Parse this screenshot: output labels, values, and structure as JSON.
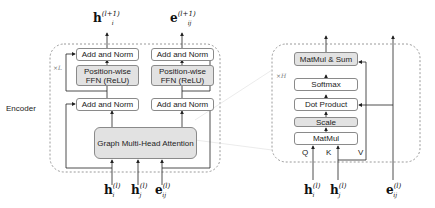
{
  "encoder": {
    "label": "Encoder",
    "repeat": "×L",
    "blocks": {
      "add_norm_top_left": "Add and Norm",
      "add_norm_top_right": "Add and Norm",
      "ffn_left": "Position-wise FFN (ReLU)",
      "ffn_right": "Position-wise FFN (ReLU)",
      "add_norm_bottom_left": "Add and Norm",
      "add_norm_bottom_right": "Add and Norm",
      "attention": "Graph Multi-Head Attention"
    },
    "outputs": {
      "h": {
        "base": "h",
        "sub": "i",
        "sup": "(l+1)"
      },
      "e": {
        "base": "e",
        "sub": "ij",
        "sup": "(l+1)"
      }
    },
    "inputs": [
      {
        "base": "h",
        "sub": "i",
        "sup": "(l)"
      },
      {
        "base": "h",
        "sub": "j",
        "sup": "(l)"
      },
      {
        "base": "e",
        "sub": "ij",
        "sup": "(l)"
      }
    ]
  },
  "attention": {
    "repeat": "×H",
    "blocks": {
      "matmul_sum": "MatMul & Sum",
      "softmax": "Softmax",
      "dot_product": "Dot Product",
      "scale": "Scale",
      "matmul": "MatMul"
    },
    "qkv": {
      "q": "Q",
      "k": "K",
      "v": "V"
    },
    "inputs": [
      {
        "base": "h",
        "sub": "i",
        "sup": "(l)"
      },
      {
        "base": "h",
        "sub": "j",
        "sup": "(l)"
      },
      {
        "base": "e",
        "sub": "ij",
        "sup": "(l)"
      }
    ]
  }
}
